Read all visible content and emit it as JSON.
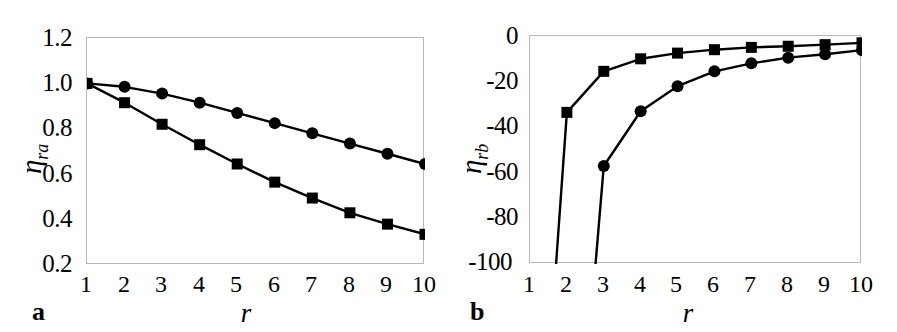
{
  "figure": {
    "panels": [
      {
        "tag": "a",
        "xlabel": "r",
        "ylabel_base": "η",
        "ylabel_sub": "ra"
      },
      {
        "tag": "b",
        "xlabel": "r",
        "ylabel_base": "η",
        "ylabel_sub": "rb"
      }
    ]
  },
  "chart_data": [
    {
      "type": "line",
      "panel": "a",
      "title": "",
      "xlabel": "r",
      "ylabel": "η_ra",
      "x": [
        1,
        2,
        3,
        4,
        5,
        6,
        7,
        8,
        9,
        10
      ],
      "xtick_labels": [
        "1",
        "2",
        "3",
        "4",
        "5",
        "6",
        "7",
        "8",
        "9",
        "10"
      ],
      "ytick_labels": [
        "1.2",
        "1.0",
        "0.8",
        "0.6",
        "0.4",
        "0.2"
      ],
      "yticks": [
        1.2,
        1.0,
        0.8,
        0.6,
        0.4,
        0.2
      ],
      "xlim": [
        1,
        10
      ],
      "ylim": [
        0.2,
        1.2
      ],
      "grid": false,
      "legend": "none",
      "series": [
        {
          "name": "circle-series",
          "marker": "circle",
          "values": [
            1.0,
            0.985,
            0.955,
            0.915,
            0.87,
            0.825,
            0.78,
            0.735,
            0.69,
            0.645
          ]
        },
        {
          "name": "square-series",
          "marker": "square",
          "values": [
            1.0,
            0.915,
            0.82,
            0.73,
            0.645,
            0.565,
            0.495,
            0.43,
            0.38,
            0.335
          ]
        }
      ]
    },
    {
      "type": "line",
      "panel": "b",
      "title": "",
      "xlabel": "r",
      "ylabel": "η_rb",
      "x": [
        1,
        2,
        3,
        4,
        5,
        6,
        7,
        8,
        9,
        10
      ],
      "xtick_labels": [
        "1",
        "2",
        "3",
        "4",
        "5",
        "6",
        "7",
        "8",
        "9",
        "10"
      ],
      "ytick_labels": [
        "0",
        "-20",
        "-40",
        "-60",
        "-80",
        "-100"
      ],
      "yticks": [
        0,
        -20,
        -40,
        -60,
        -80,
        -100
      ],
      "xlim": [
        1,
        10
      ],
      "ylim": [
        -100,
        0
      ],
      "grid": false,
      "legend": "none",
      "series": [
        {
          "name": "square-series",
          "marker": "square",
          "values": [
            -260,
            -33.5,
            -15.5,
            -10.0,
            -7.5,
            -6.0,
            -5.0,
            -4.5,
            -3.8,
            -3.0
          ]
        },
        {
          "name": "circle-series",
          "marker": "circle",
          "values": [
            -900,
            -250,
            -57.0,
            -33.0,
            -22.0,
            -15.5,
            -12.0,
            -9.5,
            -8.0,
            -6.2
          ]
        }
      ]
    }
  ]
}
